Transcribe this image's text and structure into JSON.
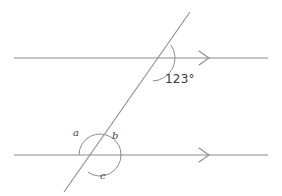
{
  "figure": {
    "type": "geometry-diagram",
    "canvas": {
      "width": 282,
      "height": 196,
      "background": "#ffffff"
    },
    "stroke_color": "#8c8c8c",
    "arc_color": "#8c8c8c",
    "text_color": "#3f3f3f",
    "stroke_width": 1
  },
  "lines": {
    "top_parallel": {
      "name": "top parallel line",
      "x1": 14,
      "y1": 58,
      "x2": 268,
      "y2": 58,
      "arrow_marker": "single-chevron-right",
      "arrow_x": 205
    },
    "bottom_parallel": {
      "name": "bottom parallel line",
      "x1": 14,
      "y1": 155,
      "x2": 268,
      "y2": 155,
      "arrow_marker": "single-chevron-right",
      "arrow_x": 205
    },
    "transversal": {
      "name": "transversal line",
      "x1": 190,
      "y1": 12,
      "x2": 64,
      "y2": 192
    }
  },
  "intersections": {
    "upper": {
      "x": 152,
      "y": 58
    },
    "lower": {
      "x": 100,
      "y": 155
    }
  },
  "arcs": {
    "angle_123": {
      "label_for": "123",
      "center_x": 152,
      "center_y": 58,
      "radius": 23,
      "start_deg": -35,
      "end_deg": 88
    },
    "angle_a": {
      "label_for": "a",
      "center_x": 100,
      "center_y": 155,
      "radius": 21,
      "start_deg": 180,
      "end_deg": 305
    },
    "angle_b": {
      "label_for": "b",
      "center_x": 100,
      "center_y": 155,
      "radius": 21,
      "start_deg": 305,
      "end_deg": 360
    },
    "angle_c": {
      "label_for": "c",
      "center_x": 100,
      "center_y": 155,
      "radius": 21,
      "start_deg": 0,
      "end_deg": 125
    }
  },
  "labels": {
    "angle_value": {
      "text": "123°",
      "x": 165,
      "y": 73
    },
    "angle_a": {
      "text": "a",
      "x": 73,
      "y": 128
    },
    "angle_b": {
      "text": "b",
      "x": 112,
      "y": 131
    },
    "angle_c": {
      "text": "c",
      "x": 100,
      "y": 171
    }
  },
  "chart_data": {
    "type": "diagram",
    "title": "",
    "elements": [
      {
        "kind": "line",
        "name": "top parallel line",
        "orientation": "horizontal",
        "y": 58,
        "arrows": 1
      },
      {
        "kind": "line",
        "name": "bottom parallel line",
        "orientation": "horizontal",
        "y": 155,
        "arrows": 1
      },
      {
        "kind": "line",
        "name": "transversal",
        "from": [
          190,
          12
        ],
        "to": [
          64,
          192
        ]
      }
    ],
    "angles": [
      {
        "label": "123°",
        "value": 123,
        "unit": "degrees",
        "at": "upper intersection",
        "position": "right of transversal, below top line"
      },
      {
        "label": "a",
        "value": null,
        "at": "lower intersection",
        "position": "upper left"
      },
      {
        "label": "b",
        "value": null,
        "at": "lower intersection",
        "position": "upper right"
      },
      {
        "label": "c",
        "value": null,
        "at": "lower intersection",
        "position": "below"
      }
    ]
  }
}
